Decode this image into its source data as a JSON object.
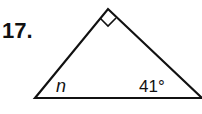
{
  "problem": {
    "number_label": "17.",
    "angle_unknown_label": "n",
    "angle_known_label": "41°",
    "right_angle_marker": "right-angle-square"
  },
  "colors": {
    "stroke": "#111111",
    "background": "#ffffff"
  }
}
